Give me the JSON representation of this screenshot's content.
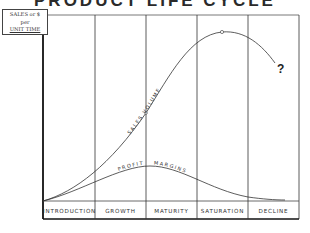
{
  "title": "PRODUCT LIFE CYCLE",
  "y_axis_label": {
    "line1": "SALES or $",
    "line2": "per",
    "line3": "UNIT TIME"
  },
  "stages": [
    "INTRODUCTION",
    "GROWTH",
    "MATURITY",
    "SATURATION",
    "DECLINE"
  ],
  "curves": {
    "sales": {
      "label": "SALES VOLUME"
    },
    "profit": {
      "label": "PROFIT",
      "label2": "MARGINS"
    }
  },
  "uncertainty_mark": "?",
  "colors": {
    "line": "#333333",
    "frame": "#222222",
    "background": "#ffffff"
  }
}
